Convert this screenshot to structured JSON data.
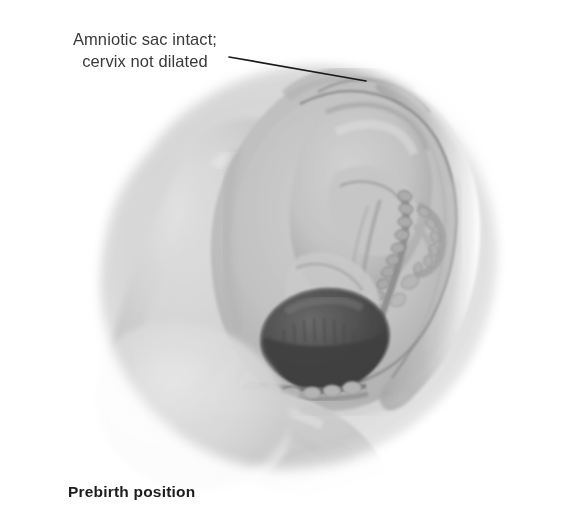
{
  "figure": {
    "title": "Prebirth position",
    "annotation": {
      "line1": "Amniotic sac intact;",
      "line2": "cervix not dilated"
    },
    "caption": "Prebirth position",
    "leader_line": {
      "from_x": 229,
      "from_y": 57,
      "to_x": 366,
      "to_y": 81,
      "color": "#1a1a1a"
    },
    "illustration": {
      "subject": "sagittal-section-pregnant-abdomen-fetus-vertex-position",
      "style": "grayscale-airbrush-medical-illustration",
      "background_color": "#ffffff",
      "tones": {
        "lightest": "#f2f2f2",
        "light": "#dcdcdc",
        "mid": "#bdbdbd",
        "mid_dark": "#9a9a9a",
        "dark": "#6e6e6e",
        "darkest": "#3c3c3c"
      },
      "structures": [
        {
          "name": "maternal-abdominal-wall",
          "tone": "#cfcfcf"
        },
        {
          "name": "uterus-fundus",
          "tone": "#b8b8b8"
        },
        {
          "name": "uterine-wall",
          "tone": "#a3a3a3"
        },
        {
          "name": "amniotic-sac",
          "tone": "#c6c6c6"
        },
        {
          "name": "fetus-body",
          "tone": "#c2c2c2"
        },
        {
          "name": "fetal-spine",
          "tone": "#8e8e8e"
        },
        {
          "name": "fetal-limbs",
          "tone": "#9c9c9c"
        },
        {
          "name": "fetal-head",
          "tone": "#4a4a4a"
        },
        {
          "name": "cervix-undilated",
          "tone": "#8a8a8a"
        },
        {
          "name": "vaginal-canal",
          "tone": "#9e9e9e"
        },
        {
          "name": "pubic-symphysis",
          "tone": "#b0b0b0"
        },
        {
          "name": "maternal-thigh",
          "tone": "#d4d4d4"
        }
      ]
    }
  }
}
